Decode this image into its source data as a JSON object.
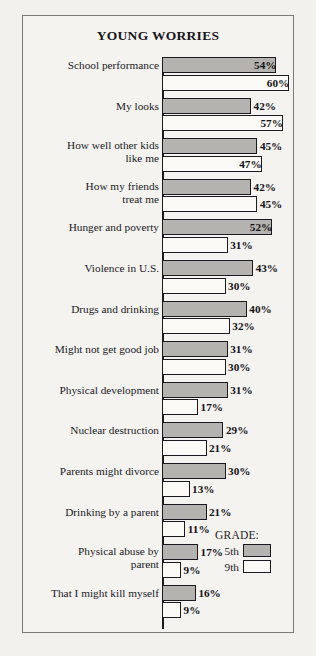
{
  "chart_data": {
    "type": "bar",
    "orientation": "horizontal",
    "title": "YOUNG WORRIES",
    "xlabel": "",
    "ylabel": "",
    "xlim": [
      0,
      60
    ],
    "grid": false,
    "legend_position": "bottom-right",
    "legend_title": "GRADE:",
    "categories": [
      "School performance",
      "My looks",
      "How well other kids like me",
      "How my friends treat me",
      "Hunger and poverty",
      "Violence in U.S.",
      "Drugs and drinking",
      "Might not get good job",
      "Physical development",
      "Nuclear destruction",
      "Parents might divorce",
      "Drinking by a parent",
      "Physical abuse by parent",
      "That I might kill myself"
    ],
    "series": [
      {
        "name": "5th",
        "color": "#b4b3b0",
        "values": [
          54,
          42,
          45,
          42,
          52,
          43,
          40,
          31,
          31,
          29,
          30,
          21,
          17,
          16
        ],
        "labels": [
          "54%",
          "42%",
          "45%",
          "42%",
          "52%",
          "43%",
          "40%",
          "31%",
          "31%",
          "29%",
          "30%",
          "21%",
          "17%",
          "16%"
        ]
      },
      {
        "name": "9th",
        "color": "#fbfaf7",
        "values": [
          60,
          57,
          47,
          45,
          31,
          30,
          32,
          30,
          17,
          21,
          13,
          11,
          9,
          9
        ],
        "labels": [
          "60%",
          "57%",
          "47%",
          "45%",
          "31%",
          "30%",
          "32%",
          "30%",
          "17%",
          "21%",
          "13%",
          "11%",
          "9%",
          "9%"
        ]
      }
    ]
  },
  "chart": {
    "label_lines": [
      [
        "School performance"
      ],
      [
        "My looks"
      ],
      [
        "How well other kids",
        "like me"
      ],
      [
        "How my friends",
        "treat me"
      ],
      [
        "Hunger and poverty"
      ],
      [
        "Violence in U.S."
      ],
      [
        "Drugs and drinking"
      ],
      [
        "Might not get good job"
      ],
      [
        "Physical development"
      ],
      [
        "Nuclear destruction"
      ],
      [
        "Parents might divorce"
      ],
      [
        "Drinking by a parent"
      ],
      [
        "Physical abuse by",
        "parent"
      ],
      [
        "That I might kill myself"
      ]
    ],
    "label_inside": [
      [
        true,
        true
      ],
      [
        false,
        true
      ],
      [
        false,
        true
      ],
      [
        false,
        false
      ],
      [
        true,
        false
      ],
      [
        false,
        false
      ],
      [
        false,
        false
      ],
      [
        false,
        false
      ],
      [
        false,
        false
      ],
      [
        false,
        false
      ],
      [
        false,
        false
      ],
      [
        false,
        false
      ],
      [
        false,
        false
      ],
      [
        false,
        false
      ]
    ]
  },
  "legend": {
    "title": "GRADE:",
    "items": [
      {
        "key": "5th",
        "swatch": "g5"
      },
      {
        "key": "9th",
        "swatch": "g9"
      }
    ]
  }
}
